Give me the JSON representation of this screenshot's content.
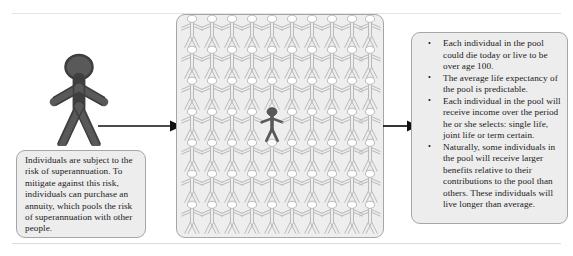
{
  "diagram": {
    "title_hidden": "",
    "type": "flow-diagram",
    "colors": {
      "actor_fill": "#595959",
      "actor_stroke": "#3f3f3f",
      "pool_fill": "#eeeeee",
      "pool_border": "#a6a6a6",
      "crowd_stroke": "#b9b9b9",
      "crowd_fill": "#ffffff",
      "highlight_figure": "#595959",
      "note_fill": "#ededed",
      "note_border": "#a6a6a6",
      "arrow": "#101010",
      "text": "#1a1a1a"
    },
    "left_note": {
      "text": "Individuals are subject to the risk of superannuation. To mitigate against this risk, individuals can purchase an annuity, which pools the risk of superannuation with other people."
    },
    "pool": {
      "rows": 7,
      "columns": 10,
      "total_figures": 70,
      "highlighted_index": {
        "row": 4,
        "column": 5
      },
      "label": "pool-of-individuals"
    },
    "right_note": {
      "bullets": [
        "Each individual in the pool could die today or live to be over age 100.",
        "The average life expectancy of the pool is predictable.",
        "Each individual in the pool will receive income over the period he or she selects: single life, joint life or term certain.",
        "Naturally, some individuals in the pool will receive larger benefits relative to their contributions to the pool than others. These individuals will live longer than average."
      ]
    },
    "arrows": [
      {
        "name": "individual-to-pool",
        "direction": "right"
      },
      {
        "name": "pool-to-outcomes",
        "direction": "right"
      }
    ]
  }
}
